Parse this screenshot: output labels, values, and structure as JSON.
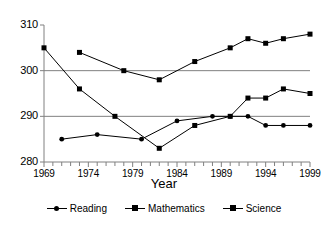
{
  "chart_data": {
    "type": "line",
    "title": "",
    "subtitle": "",
    "xlabel": "Year",
    "ylabel": "",
    "xlim": [
      1969,
      1999
    ],
    "ylim": [
      280,
      310
    ],
    "yticks": [
      280,
      290,
      300,
      310
    ],
    "xticks": [
      1969,
      1974,
      1979,
      1984,
      1989,
      1994,
      1999
    ],
    "xtick_labels": [
      "1969",
      "1974",
      "1979",
      "1984",
      "1989",
      "1994",
      "1999"
    ],
    "ytick_labels": [
      "280",
      "290",
      "300",
      "310"
    ],
    "minor_xticks_every": 1,
    "grid": "horizontal-at-290-and-300",
    "legend_position": "bottom-center",
    "series": [
      {
        "name": "Reading",
        "marker": "circle",
        "color": "#000000",
        "x": [
          1971,
          1975,
          1980,
          1984,
          1988,
          1990,
          1992,
          1994,
          1996,
          1999
        ],
        "y": [
          285,
          286,
          285,
          289,
          290,
          290,
          290,
          288,
          288,
          288
        ]
      },
      {
        "name": "Mathematics",
        "marker": "square",
        "color": "#000000",
        "x": [
          1973,
          1978,
          1982,
          1986,
          1990,
          1992,
          1994,
          1996,
          1999
        ],
        "y": [
          304,
          300,
          298,
          302,
          305,
          307,
          306,
          307,
          308
        ]
      },
      {
        "name": "Science",
        "marker": "square",
        "color": "#000000",
        "x": [
          1969,
          1973,
          1977,
          1982,
          1986,
          1990,
          1992,
          1994,
          1996,
          1999
        ],
        "y": [
          305,
          296,
          290,
          283,
          288,
          290,
          294,
          294,
          296,
          295
        ]
      }
    ]
  },
  "legend": {
    "items": [
      {
        "label": "Reading",
        "marker": "circle"
      },
      {
        "label": "Mathematics",
        "marker": "square"
      },
      {
        "label": "Science",
        "marker": "square"
      }
    ]
  },
  "axis": {
    "x_title": "Year"
  },
  "colors": {
    "ink": "#000000",
    "gridline": "#808080",
    "background": "#ffffff"
  }
}
